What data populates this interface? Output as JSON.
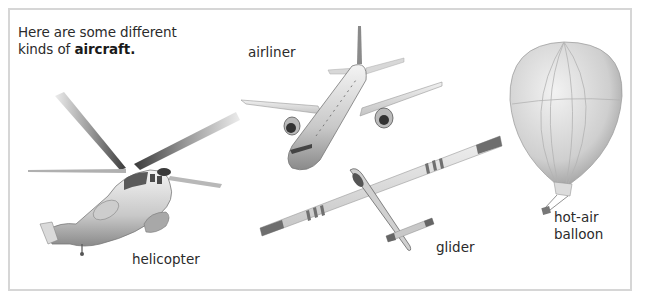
{
  "intro": {
    "line1": "Here are some different",
    "line2_prefix": "kinds of ",
    "line2_bold": "aircraft."
  },
  "aircraft": [
    {
      "id": "airliner",
      "label": "airliner",
      "icon": "airliner-illustration"
    },
    {
      "id": "helicopter",
      "label": "helicopter",
      "icon": "helicopter-illustration"
    },
    {
      "id": "glider",
      "label": "glider",
      "icon": "glider-illustration"
    },
    {
      "id": "balloon",
      "label_line1": "hot-air",
      "label_line2": "balloon",
      "icon": "hot-air-balloon-illustration"
    }
  ],
  "colors": {
    "border": "#d6d6d6",
    "text": "#2b2b2b",
    "art_light": "#e6e6e6",
    "art_mid": "#b8b8b8",
    "art_dark": "#6e6e6e"
  }
}
